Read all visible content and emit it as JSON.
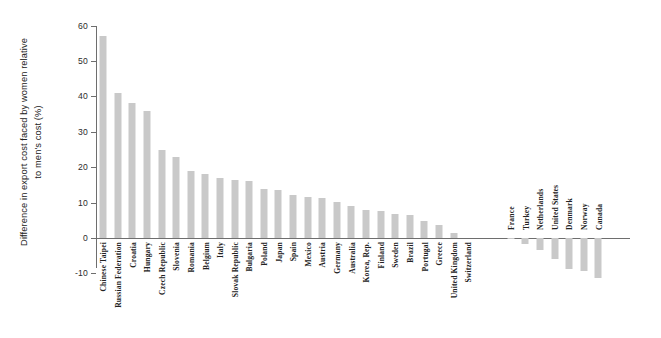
{
  "chart_data": {
    "type": "bar",
    "title": "",
    "subtitle": "",
    "xlabel": "",
    "ylabel": "Difference in export cost faced by women relative to men's cost (%)",
    "ylim": [
      -10,
      60
    ],
    "yticks": [
      -10,
      0,
      10,
      20,
      30,
      40,
      50,
      60
    ],
    "ytick_labels": [
      "-10",
      "0",
      "10",
      "20",
      "30",
      "40",
      "50",
      "60"
    ],
    "grid": false,
    "legend": null,
    "bar_color": "#c9c9c9",
    "axis_color": "#6e6e6e",
    "background": "#ffffff",
    "gap_after_index": 25,
    "categories": [
      "Chinese Taipei",
      "Russian Federation",
      "Croatia",
      "Hungary",
      "Czech Republic",
      "Slovenia",
      "Romania",
      "Belgium",
      "Italy",
      "Slovak Republic",
      "Bulgaria",
      "Poland",
      "Japan",
      "Spain",
      "Mexico",
      "Austria",
      "Germany",
      "Australia",
      "Korea, Rep.",
      "Finland",
      "Sweden",
      "Brazil",
      "Portugal",
      "Greece",
      "United Kingdom",
      "Switzerland",
      "France",
      "Turkey",
      "Netherlands",
      "United States",
      "Denmark",
      "Norway",
      "Canada"
    ],
    "values": [
      57.0,
      41.0,
      38.0,
      36.0,
      24.8,
      23.0,
      19.0,
      18.0,
      17.0,
      16.3,
      16.0,
      13.8,
      13.5,
      12.2,
      11.5,
      11.3,
      10.2,
      9.0,
      7.8,
      7.6,
      6.8,
      6.6,
      4.8,
      3.6,
      1.4,
      0.0,
      -0.4,
      -1.6,
      -3.4,
      -6.0,
      -8.8,
      -9.4,
      -11.2
    ]
  }
}
